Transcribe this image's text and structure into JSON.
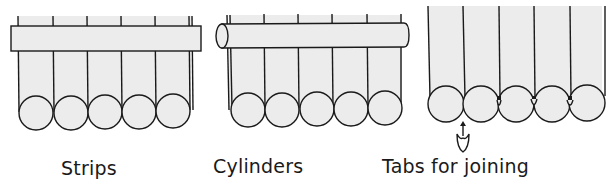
{
  "figure": {
    "panels": [
      {
        "id": "strips",
        "label": "Strips",
        "strip_count": 5,
        "top_element": "flat strip (rectangle)"
      },
      {
        "id": "cylinders",
        "label": "Cylinders",
        "strip_count": 5,
        "top_element": "cylinder (rod)"
      },
      {
        "id": "tabs",
        "label": "Tabs for joining",
        "strip_count": 5,
        "top_element": "none",
        "annotation": "arrow pointing to joining tab"
      }
    ],
    "colors": {
      "line": "#1a1a1a",
      "fill": "#ececec",
      "background": "#ffffff"
    }
  }
}
